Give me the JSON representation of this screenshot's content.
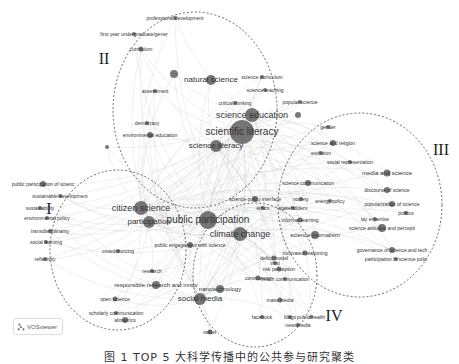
{
  "figure": {
    "caption": "图 1  TOP 5 大科学传播中的公共参与研究聚类",
    "watermark": "VOSviewer",
    "colors": {
      "node": "#555555",
      "edge": "#bbbbbb",
      "cluster_outline": "#444444"
    }
  },
  "clusters": [
    {
      "id": "I",
      "label": "I",
      "x": 49,
      "y": 209,
      "ellipse": {
        "cx": 118,
        "cy": 250,
        "rx": 68,
        "ry": 80
      }
    },
    {
      "id": "II",
      "label": "II",
      "x": 104,
      "y": 59,
      "ellipse": {
        "cx": 195,
        "cy": 110,
        "rx": 82,
        "ry": 98
      }
    },
    {
      "id": "III",
      "label": "III",
      "x": 441,
      "y": 150,
      "ellipse": {
        "cx": 360,
        "cy": 205,
        "rx": 82,
        "ry": 92
      }
    },
    {
      "id": "IV",
      "label": "IV",
      "x": 334,
      "y": 316,
      "ellipse": {
        "cx": 255,
        "cy": 275,
        "rx": 62,
        "ry": 72
      }
    }
  ],
  "nodes": [
    {
      "label": "professional development",
      "x": 175,
      "y": 18,
      "r": 2,
      "size": 5
    },
    {
      "label": "first year undergraduate/gener",
      "x": 134,
      "y": 34,
      "r": 2,
      "size": 5
    },
    {
      "label": "curriculum",
      "x": 141,
      "y": 49,
      "r": 2.5,
      "size": 5
    },
    {
      "label": "",
      "x": 174,
      "y": 74,
      "r": 4,
      "size": 0
    },
    {
      "label": "natural science",
      "x": 211,
      "y": 80,
      "r": 5,
      "size": 8
    },
    {
      "label": "assessment",
      "x": 155,
      "y": 91,
      "r": 2,
      "size": 5
    },
    {
      "label": "science curriculum",
      "x": 262,
      "y": 77,
      "r": 2,
      "size": 5
    },
    {
      "label": "science teaching",
      "x": 265,
      "y": 90,
      "r": 2,
      "size": 5
    },
    {
      "label": "popular science",
      "x": 300,
      "y": 102,
      "r": 2,
      "size": 5
    },
    {
      "label": "critical thinking",
      "x": 235,
      "y": 103,
      "r": 2,
      "size": 5
    },
    {
      "label": "science education",
      "x": 252,
      "y": 115,
      "r": 7,
      "size": 9
    },
    {
      "label": "scientific literacy",
      "x": 242,
      "y": 132,
      "r": 12,
      "size": 10
    },
    {
      "label": "science literacy",
      "x": 216,
      "y": 146,
      "r": 6,
      "size": 8
    },
    {
      "label": "democracy",
      "x": 147,
      "y": 123,
      "r": 2,
      "size": 5
    },
    {
      "label": "environmental education",
      "x": 150,
      "y": 135,
      "r": 3,
      "size": 5
    },
    {
      "label": "",
      "x": 107,
      "y": 147,
      "r": 2,
      "size": 0
    },
    {
      "label": "",
      "x": 298,
      "y": 115,
      "r": 3,
      "size": 0
    },
    {
      "label": "gender",
      "x": 328,
      "y": 127,
      "r": 2,
      "size": 5
    },
    {
      "label": "science and religion",
      "x": 333,
      "y": 143,
      "r": 3,
      "size": 5
    },
    {
      "label": "evolution",
      "x": 321,
      "y": 153,
      "r": 2,
      "size": 5
    },
    {
      "label": "social representation",
      "x": 350,
      "y": 162,
      "r": 2,
      "size": 5
    },
    {
      "label": "media and science",
      "x": 387,
      "y": 173,
      "r": 3.5,
      "size": 6
    },
    {
      "label": "discourse of science",
      "x": 387,
      "y": 190,
      "r": 3,
      "size": 5
    },
    {
      "label": "popularization of science",
      "x": 392,
      "y": 204,
      "r": 3,
      "size": 5
    },
    {
      "label": "politics",
      "x": 406,
      "y": 213,
      "r": 2,
      "size": 5
    },
    {
      "label": "lay expertise",
      "x": 375,
      "y": 219,
      "r": 2,
      "size": 5
    },
    {
      "label": "science attitudes and percepti",
      "x": 382,
      "y": 228,
      "r": 4,
      "size": 5
    },
    {
      "label": "governance of science and tech",
      "x": 392,
      "y": 250,
      "r": 3,
      "size": 5
    },
    {
      "label": "participation in science polic",
      "x": 396,
      "y": 259,
      "r": 2,
      "size": 5
    },
    {
      "label": "science communication",
      "x": 308,
      "y": 183,
      "r": 3,
      "size": 5
    },
    {
      "label": "energy policy",
      "x": 330,
      "y": 201,
      "r": 2,
      "size": 5
    },
    {
      "label": "science-policy interface",
      "x": 255,
      "y": 199,
      "r": 3,
      "size": 5
    },
    {
      "label": "society",
      "x": 301,
      "y": 199,
      "r": 2,
      "size": 5
    },
    {
      "label": "ethics",
      "x": 263,
      "y": 208,
      "r": 2,
      "size": 5
    },
    {
      "label": "stakeholders",
      "x": 293,
      "y": 208,
      "r": 2,
      "size": 5
    },
    {
      "label": "informal learning",
      "x": 300,
      "y": 220,
      "r": 2.5,
      "size": 5
    },
    {
      "label": "science journalism",
      "x": 315,
      "y": 235,
      "r": 4,
      "size": 6
    },
    {
      "label": "motivated reasoning",
      "x": 305,
      "y": 253,
      "r": 2.5,
      "size": 5
    },
    {
      "label": "public participation of scienc",
      "x": 43,
      "y": 184,
      "r": 3,
      "size": 5
    },
    {
      "label": "sustainable development",
      "x": 60,
      "y": 196,
      "r": 2,
      "size": 5
    },
    {
      "label": "citizen science",
      "x": 141,
      "y": 208,
      "r": 7,
      "size": 9
    },
    {
      "label": "sustainability",
      "x": 40,
      "y": 208,
      "r": 2,
      "size": 5
    },
    {
      "label": "participation",
      "x": 149,
      "y": 222,
      "r": 6,
      "size": 8
    },
    {
      "label": "environmental policy",
      "x": 47,
      "y": 218,
      "r": 2,
      "size": 5
    },
    {
      "label": "transdisciplinarity",
      "x": 50,
      "y": 231,
      "r": 2,
      "size": 5
    },
    {
      "label": "social learning",
      "x": 46,
      "y": 242,
      "r": 2,
      "size": 5
    },
    {
      "label": "crowdsourcing",
      "x": 118,
      "y": 251,
      "r": 2,
      "size": 5
    },
    {
      "label": "reflexivity",
      "x": 45,
      "y": 259,
      "r": 2,
      "size": 5
    },
    {
      "label": "public participation",
      "x": 208,
      "y": 220,
      "r": 9,
      "size": 10
    },
    {
      "label": "climate change",
      "x": 240,
      "y": 234,
      "r": 7,
      "size": 9
    },
    {
      "label": "public engagement with science",
      "x": 190,
      "y": 245,
      "r": 3,
      "size": 5
    },
    {
      "label": "research",
      "x": 152,
      "y": 271,
      "r": 2,
      "size": 5
    },
    {
      "label": "responsible research and innov",
      "x": 156,
      "y": 285,
      "r": 4,
      "size": 6
    },
    {
      "label": "nanotechnology",
      "x": 220,
      "y": 289,
      "r": 4,
      "size": 6
    },
    {
      "label": "social media",
      "x": 200,
      "y": 299,
      "r": 6,
      "size": 8
    },
    {
      "label": "risk perception",
      "x": 279,
      "y": 269,
      "r": 2.5,
      "size": 5
    },
    {
      "label": "controversy",
      "x": 258,
      "y": 278,
      "r": 2.5,
      "size": 5
    },
    {
      "label": "health communication",
      "x": 285,
      "y": 279,
      "r": 2,
      "size": 5
    },
    {
      "label": "trust",
      "x": 275,
      "y": 263,
      "r": 2,
      "size": 5
    },
    {
      "label": "deficit model",
      "x": 274,
      "y": 258,
      "r": 2.5,
      "size": 5
    },
    {
      "label": "mass media",
      "x": 280,
      "y": 300,
      "r": 2.5,
      "size": 5
    },
    {
      "label": "facebook",
      "x": 262,
      "y": 317,
      "r": 2,
      "size": 5
    },
    {
      "label": "blogs",
      "x": 290,
      "y": 317,
      "r": 2,
      "size": 5
    },
    {
      "label": "public health",
      "x": 311,
      "y": 317,
      "r": 2,
      "size": 5
    },
    {
      "label": "newsmedia",
      "x": 298,
      "y": 325,
      "r": 2,
      "size": 5
    },
    {
      "label": "open science",
      "x": 115,
      "y": 299,
      "r": 2.5,
      "size": 5
    },
    {
      "label": "scholarly communication",
      "x": 116,
      "y": 313,
      "r": 2,
      "size": 5
    },
    {
      "label": "altmetrics",
      "x": 125,
      "y": 320,
      "r": 3,
      "size": 5
    },
    {
      "label": "twitter",
      "x": 210,
      "y": 332,
      "r": 2.5,
      "size": 5
    }
  ]
}
